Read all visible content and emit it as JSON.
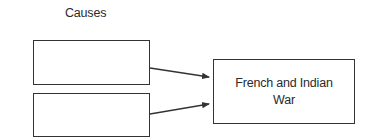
{
  "diagram": {
    "header_label": "Causes",
    "cause_boxes": [
      {
        "text": ""
      },
      {
        "text": ""
      }
    ],
    "effect_box": {
      "text": "French and Indian War"
    },
    "colors": {
      "stroke": "#333333",
      "text": "#2a2a2a",
      "background": "#ffffff"
    }
  }
}
